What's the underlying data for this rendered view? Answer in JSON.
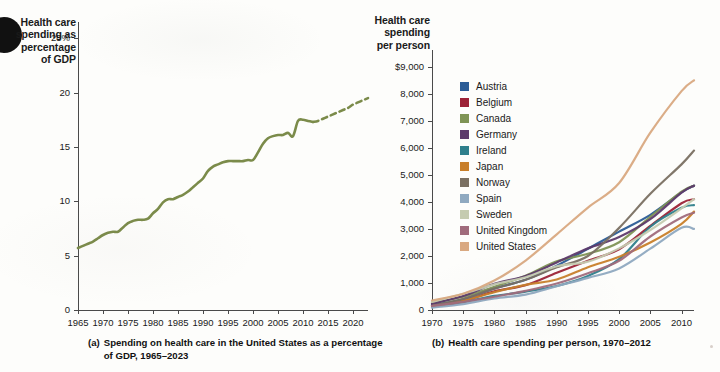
{
  "figure": {
    "panels": [
      {
        "id": "a",
        "axis_title": "Health care\nspending as\npercentage\nof GDP",
        "caption_tag": "(a)",
        "caption_text": "Spending on health care in the United States as a percentage of GDP, 1965–2023"
      },
      {
        "id": "b",
        "axis_title": "Health care\nspending\nper person",
        "caption_tag": "(b)",
        "caption_text": "Health care spending per person, 1970–2012"
      }
    ]
  },
  "chart_data": [
    {
      "type": "line",
      "panel": "a",
      "title": "Spending on health care in the United States as a percentage of GDP, 1965–2023",
      "xlabel": "",
      "ylabel": "Health care spending as percentage of GDP",
      "xlim": [
        1965,
        2023
      ],
      "ylim": [
        0,
        26.5
      ],
      "xticks": [
        1965,
        1970,
        1975,
        1980,
        1985,
        1990,
        1995,
        2000,
        2005,
        2010,
        2015,
        2020
      ],
      "yticks": [
        0,
        5,
        10,
        15,
        20,
        25
      ],
      "ytick_labels": [
        "0",
        "5",
        "10",
        "15",
        "20",
        "25%"
      ],
      "grid": false,
      "legend": "none",
      "line_color": "#7b8b4a",
      "series": [
        {
          "name": "United States (actual)",
          "style": "solid",
          "x": [
            1965,
            1966,
            1967,
            1968,
            1969,
            1970,
            1971,
            1972,
            1973,
            1974,
            1975,
            1976,
            1977,
            1978,
            1979,
            1980,
            1981,
            1982,
            1983,
            1984,
            1985,
            1986,
            1987,
            1988,
            1989,
            1990,
            1991,
            1992,
            1993,
            1994,
            1995,
            1996,
            1997,
            1998,
            1999,
            2000,
            2001,
            2002,
            2003,
            2004,
            2005,
            2006,
            2007,
            2008,
            2009,
            2010,
            2011,
            2012
          ],
          "values": [
            5.7,
            5.9,
            6.1,
            6.3,
            6.6,
            6.9,
            7.1,
            7.2,
            7.2,
            7.6,
            8.0,
            8.2,
            8.3,
            8.3,
            8.4,
            8.9,
            9.3,
            9.9,
            10.2,
            10.2,
            10.4,
            10.6,
            10.9,
            11.3,
            11.7,
            12.1,
            12.8,
            13.2,
            13.4,
            13.6,
            13.7,
            13.7,
            13.7,
            13.7,
            13.8,
            13.8,
            14.5,
            15.3,
            15.8,
            16.0,
            16.1,
            16.1,
            16.3,
            16.0,
            17.4,
            17.5,
            17.4,
            17.3
          ]
        },
        {
          "name": "United States (projected)",
          "style": "dashed",
          "x": [
            2012,
            2013,
            2014,
            2015,
            2016,
            2017,
            2018,
            2019,
            2020,
            2021,
            2022,
            2023
          ],
          "values": [
            17.3,
            17.4,
            17.6,
            17.8,
            18.0,
            18.2,
            18.4,
            18.6,
            18.9,
            19.1,
            19.3,
            19.5
          ]
        }
      ]
    },
    {
      "type": "line",
      "panel": "b",
      "title": "Health care spending per person, 1970–2012",
      "xlabel": "",
      "ylabel": "Health care spending per person",
      "xlim": [
        1970,
        2012
      ],
      "ylim": [
        0,
        9400
      ],
      "xticks": [
        1970,
        1975,
        1980,
        1985,
        1990,
        1995,
        2000,
        2005,
        2010
      ],
      "yticks": [
        0,
        1000,
        2000,
        3000,
        4000,
        5000,
        6000,
        7000,
        8000,
        9000
      ],
      "ytick_labels": [
        "0",
        "1,000",
        "2,000",
        "3,000",
        "4,000",
        "5,000",
        "6,000",
        "7,000",
        "8,000",
        "9,000"
      ],
      "grid": false,
      "legend": "inside-upper-left",
      "x": [
        1970,
        1975,
        1980,
        1985,
        1990,
        1995,
        2000,
        2005,
        2010,
        2012
      ],
      "series": [
        {
          "name": "Austria",
          "color": "#2b5c96",
          "values": [
            190,
            400,
            800,
            1120,
            1640,
            2270,
            2900,
            3520,
            4350,
            4600
          ]
        },
        {
          "name": "Belgium",
          "color": "#9c2236",
          "values": [
            150,
            330,
            690,
            920,
            1380,
            1820,
            2250,
            3110,
            3950,
            4100
          ]
        },
        {
          "name": "Canada",
          "color": "#7f9455",
          "values": [
            260,
            490,
            860,
            1270,
            1800,
            2080,
            2510,
            3450,
            4380,
            4600
          ]
        },
        {
          "name": "Germany",
          "color": "#5d3a6b",
          "values": [
            230,
            520,
            970,
            1260,
            1760,
            2280,
            2700,
            3360,
            4340,
            4600
          ]
        },
        {
          "name": "Ireland",
          "color": "#2f7f8c",
          "values": [
            110,
            290,
            520,
            680,
            890,
            1260,
            1880,
            3080,
            3780,
            3880
          ]
        },
        {
          "name": "Japan",
          "color": "#c87f2a",
          "values": [
            140,
            340,
            660,
            930,
            1130,
            1580,
            1970,
            2500,
            3190,
            3640
          ]
        },
        {
          "name": "Norway",
          "color": "#7a7062",
          "values": [
            150,
            410,
            790,
            1120,
            1580,
            2000,
            3040,
            4300,
            5390,
            5900
          ]
        },
        {
          "name": "Spain",
          "color": "#8fa9c0",
          "values": [
            90,
            220,
            430,
            570,
            880,
            1190,
            1540,
            2270,
            3040,
            3000
          ]
        },
        {
          "name": "Sweden",
          "color": "#c5cbb0",
          "values": [
            300,
            600,
            950,
            1210,
            1620,
            1790,
            2280,
            2960,
            3760,
            4100
          ]
        },
        {
          "name": "United Kingdom",
          "color": "#a06b7c",
          "values": [
            150,
            300,
            490,
            710,
            980,
            1360,
            1820,
            2720,
            3420,
            3600
          ]
        },
        {
          "name": "United States",
          "color": "#d9a981",
          "values": [
            350,
            600,
            1090,
            1830,
            2800,
            3790,
            4700,
            6560,
            8100,
            8500
          ]
        }
      ]
    }
  ]
}
